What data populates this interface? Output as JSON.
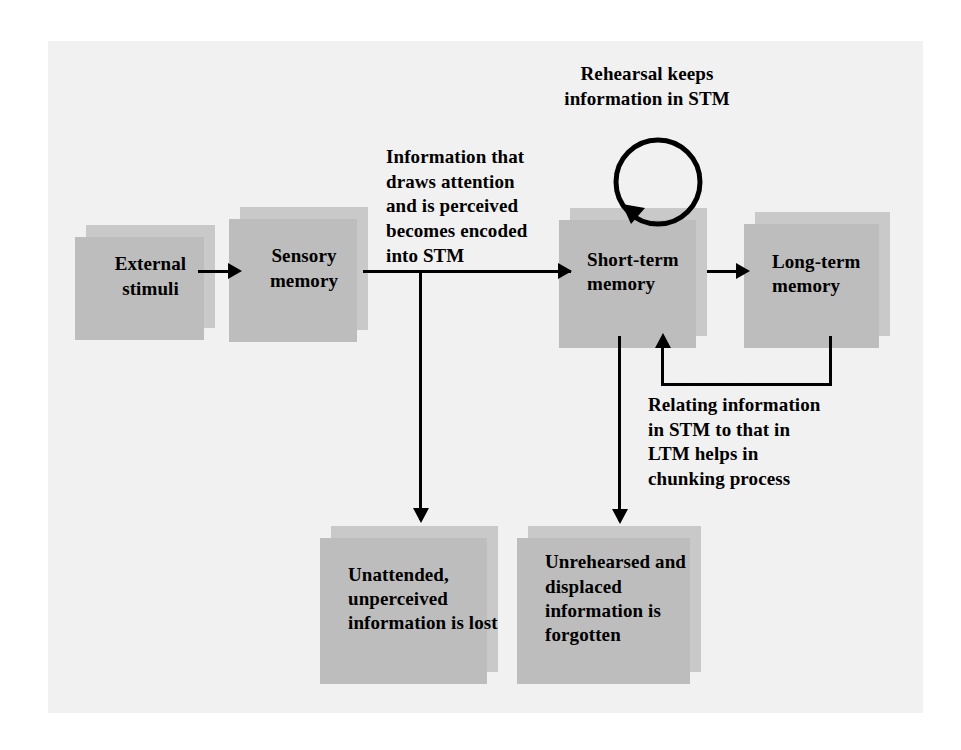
{
  "diagram": {
    "colors": {
      "page_background": "#ffffff",
      "panel_background": "#f1f1f1",
      "box_fill": "#c9c9c9",
      "box_shadow": "#bdbdbd",
      "ink": "#000000"
    },
    "nodes": [
      {
        "id": "external-stimuli",
        "label": "External\nstimuli"
      },
      {
        "id": "sensory-memory",
        "label": "Sensory\nmemory"
      },
      {
        "id": "short-term-memory",
        "label": "Short-term\nmemory"
      },
      {
        "id": "long-term-memory",
        "label": "Long-term\nmemory"
      },
      {
        "id": "unattended-lost",
        "label": "Unattended,\nunperceived\ninformation\nis lost"
      },
      {
        "id": "unrehearsed-forgotten",
        "label": "Unrehearsed\nand displaced\ninformation\nis forgotten"
      }
    ],
    "captions": [
      {
        "id": "rehearsal-caption",
        "text": "Rehearsal keeps\ninformation in STM"
      },
      {
        "id": "encoding-caption",
        "text": "Information that\ndraws attention\nand is perceived\nbecomes encoded\ninto STM"
      },
      {
        "id": "chunking-caption",
        "text": "Relating information\nin STM to that in\nLTM helps in\nchunking process"
      }
    ],
    "connectors": [
      {
        "id": "stimuli-to-sensory",
        "from": "external-stimuli",
        "to": "sensory-memory",
        "style": "arrow-right"
      },
      {
        "id": "sensory-to-stm",
        "from": "sensory-memory",
        "to": "short-term-memory",
        "style": "arrow-right"
      },
      {
        "id": "sensory-to-lost",
        "from": "sensory-memory",
        "to": "unattended-lost",
        "style": "arrow-down-branch"
      },
      {
        "id": "stm-to-ltm",
        "from": "short-term-memory",
        "to": "long-term-memory",
        "style": "arrow-right"
      },
      {
        "id": "stm-to-forgotten",
        "from": "short-term-memory",
        "to": "unrehearsed-forgotten",
        "style": "arrow-down"
      },
      {
        "id": "ltm-to-stm-feedback",
        "from": "long-term-memory",
        "to": "short-term-memory",
        "style": "arrow-up-loopback"
      },
      {
        "id": "rehearsal-loop",
        "from": "short-term-memory",
        "to": "short-term-memory",
        "style": "circular-self-loop"
      }
    ]
  }
}
